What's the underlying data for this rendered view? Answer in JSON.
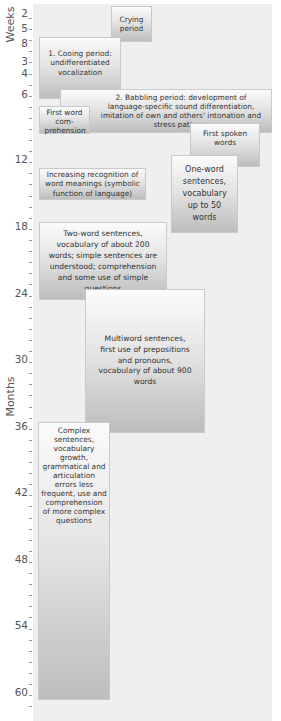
{
  "axis": {
    "weeks_label": "Weeks",
    "months_label": "Months",
    "ticks": [
      {
        "label": "2",
        "unit": "weeks"
      },
      {
        "label": "5",
        "unit": "weeks"
      },
      {
        "label": "8",
        "unit": "weeks"
      },
      {
        "label": "3",
        "unit": "months"
      },
      {
        "label": "4",
        "unit": "months"
      },
      {
        "label": "6",
        "unit": "months"
      },
      {
        "label": "12",
        "unit": "months"
      },
      {
        "label": "18",
        "unit": "months"
      },
      {
        "label": "24",
        "unit": "months"
      },
      {
        "label": "30",
        "unit": "months"
      },
      {
        "label": "36",
        "unit": "months"
      },
      {
        "label": "42",
        "unit": "months"
      },
      {
        "label": "48",
        "unit": "months"
      },
      {
        "label": "54",
        "unit": "months"
      },
      {
        "label": "60",
        "unit": "months"
      }
    ]
  },
  "stages": [
    {
      "id": "crying",
      "text": "Crying period"
    },
    {
      "id": "cooing",
      "text": "1. Cooing period: undifferentiated vocalization"
    },
    {
      "id": "babbling",
      "text": "2. Babbling period: development of language-specific sound differentiation, imitation of own and others' intonation and stress patterns"
    },
    {
      "id": "first-word-comprehension",
      "text": "First word com-prehension"
    },
    {
      "id": "first-spoken-words",
      "text": "First spoken words"
    },
    {
      "id": "word-meanings",
      "text": "Increasing recognition of word meanings (symbolic function of language)"
    },
    {
      "id": "one-word",
      "text": "One-word sentences, vocabulary up to 50 words"
    },
    {
      "id": "two-word",
      "text": "Two-word sentences, vocabulary of about 200 words; simple sentences are understood; comprehension and some use of simple questions"
    },
    {
      "id": "multiword",
      "text": "Multiword sentences, first use of prepositions and pronouns, vocabulary of about 900 words"
    },
    {
      "id": "complex",
      "text": "Complex sentences, vocabulary growth, grammatical and articulation errors less frequent, use and comprehension of more complex questions"
    }
  ]
}
